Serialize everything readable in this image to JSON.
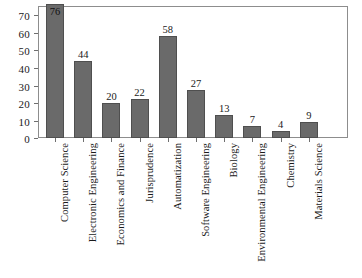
{
  "chart_data": {
    "type": "bar",
    "title": "",
    "subtitle": "",
    "xlabel": "",
    "ylabel": "",
    "ylim": [
      0,
      75
    ],
    "yticks": [
      0,
      10,
      20,
      30,
      40,
      50,
      60,
      70
    ],
    "grid": false,
    "legend": false,
    "bar_color": "#6a6a6a",
    "bar_edge_color": "#4f4f4f",
    "frame_color": "#8d8d8d",
    "categories": [
      "Computer Science",
      "Electronic Engineering",
      "Economics and Finance",
      "Jurisprudence",
      "Automatization",
      "Software Engineering",
      "Biology",
      "Environmental Engineering",
      "Chemistry",
      "Materials Science"
    ],
    "values": [
      76,
      44,
      20,
      22,
      58,
      27,
      13,
      7,
      4,
      9
    ],
    "value_labels": [
      "76",
      "44",
      "20",
      "22",
      "58",
      "27",
      "13",
      "7",
      "4",
      "9"
    ]
  }
}
